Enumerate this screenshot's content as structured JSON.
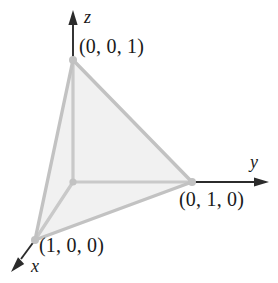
{
  "figure": {
    "background_color": "#ffffff"
  },
  "axes": [
    {
      "name": "z",
      "label": "z",
      "direction": "up",
      "color": "#2b2b2b"
    },
    {
      "name": "y",
      "label": "y",
      "direction": "right",
      "color": "#2b2b2b"
    },
    {
      "name": "x",
      "label": "x",
      "direction": "down-left",
      "color": "#2b2b2b"
    }
  ],
  "vertices": [
    {
      "name": "vertex-001",
      "label": "(0, 0, 1)",
      "coords": [
        0,
        0,
        1
      ],
      "px": [
        73,
        60
      ]
    },
    {
      "name": "vertex-010",
      "label": "(0, 1, 0)",
      "coords": [
        0,
        1,
        0
      ],
      "px": [
        192,
        182
      ]
    },
    {
      "name": "vertex-100",
      "label": "(1, 0, 0)",
      "coords": [
        1,
        0,
        0
      ],
      "px": [
        35,
        240
      ]
    },
    {
      "name": "origin",
      "label": "",
      "coords": [
        0,
        0,
        0
      ],
      "px": [
        73,
        182
      ]
    }
  ],
  "surface": {
    "name": "shaded-triangle",
    "fill_color": "#f1f1f1",
    "edge_color": "#c2c2c2"
  },
  "colors": {
    "axis_dark": "#2b2b2b",
    "axis_light": "#c9c9c9",
    "edge": "#c2c2c2",
    "fill": "#f1f1f1",
    "text": "#1a1a1a"
  }
}
